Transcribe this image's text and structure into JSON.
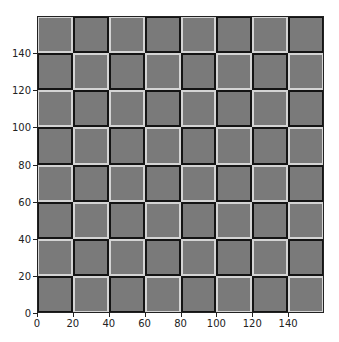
{
  "chart_data": {
    "type": "heatmap",
    "title": "",
    "xlabel": "",
    "ylabel": "",
    "xlim": [
      0,
      160
    ],
    "ylim": [
      0,
      160
    ],
    "grid": false,
    "rows": 8,
    "cols": 8,
    "cell_size": 20,
    "fill_color": "#7a7a7a",
    "light_border_color": "#d4d4d4",
    "dark_border_color": "#141414",
    "pattern_rule": "light border when (row_from_top + col) is even",
    "x_ticks": [
      "0",
      "20",
      "40",
      "60",
      "80",
      "100",
      "120",
      "140"
    ],
    "y_ticks": [
      "0",
      "20",
      "40",
      "60",
      "80",
      "100",
      "120",
      "140"
    ]
  }
}
